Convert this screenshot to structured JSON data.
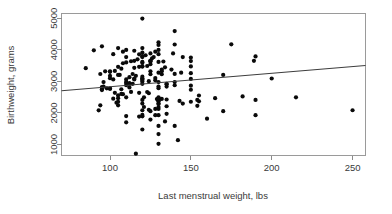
{
  "chart_data": {
    "type": "scatter",
    "title": "",
    "xlabel": "Last menstrual weight, lbs",
    "ylabel": "Birthweight, grams",
    "xlim": [
      70,
      258
    ],
    "ylim": [
      650,
      5150
    ],
    "xticks": [
      100,
      150,
      200,
      250
    ],
    "yticks": [
      1000,
      2000,
      3000,
      4000,
      5000
    ],
    "xtick_labels": [
      "100",
      "150",
      "200",
      "250"
    ],
    "ytick_labels": [
      "1000",
      "2000",
      "3000",
      "4000",
      "5000"
    ],
    "grid": false,
    "legend": "none",
    "point_color": "#0a0a0a",
    "point_size_px": 2.1,
    "n_points": 189,
    "fit_line": {
      "name": "least-squares fit",
      "color": "#3d3d3d",
      "x_start": 70,
      "y_start": 2700,
      "x_end": 258,
      "y_end": 3500,
      "slope": 4.43,
      "intercept": 2390
    },
    "x": [
      182,
      155,
      105,
      108,
      107,
      124,
      118,
      103,
      123,
      113,
      95,
      150,
      95,
      107,
      100,
      100,
      98,
      130,
      112,
      95,
      135,
      96,
      130,
      150,
      140,
      110,
      135,
      112,
      135,
      120,
      114,
      112,
      110,
      96,
      130,
      140,
      110,
      120,
      124,
      128,
      120,
      115,
      110,
      102,
      150,
      120,
      115,
      200,
      120,
      100,
      128,
      112,
      120,
      116,
      100,
      170,
      106,
      105,
      132,
      125,
      94,
      114,
      140,
      150,
      144,
      130,
      100,
      97,
      100,
      125,
      132,
      103,
      138,
      132,
      107,
      85,
      115,
      134,
      118,
      105,
      120,
      150,
      120,
      123,
      125,
      108,
      120,
      110,
      130,
      120,
      133,
      125,
      113,
      150,
      115,
      125,
      125,
      189,
      117,
      126,
      150,
      110,
      120,
      127,
      145,
      190,
      120,
      122,
      118,
      102,
      130,
      139,
      125,
      120,
      108,
      128,
      115,
      90,
      130,
      110,
      120,
      105,
      95,
      130,
      140,
      175,
      130,
      140,
      120,
      116,
      130,
      142,
      130,
      120,
      130,
      140,
      110,
      134,
      125,
      160,
      118,
      120,
      110,
      190,
      130,
      128,
      120,
      135,
      170,
      125,
      93,
      120,
      250,
      124,
      130,
      128,
      121,
      130,
      135,
      154,
      105,
      94,
      130,
      120,
      145,
      130,
      104,
      105,
      150,
      155,
      143,
      130,
      130,
      130,
      154,
      120,
      190,
      130,
      135,
      129,
      132,
      102,
      105,
      165,
      130,
      110,
      121,
      130,
      215,
      215
    ],
    "y": [
      2523,
      2551,
      2557,
      2594,
      2600,
      2622,
      2637,
      2637,
      2663,
      2665,
      2722,
      2733,
      2750,
      2750,
      2769,
      2769,
      2778,
      2782,
      2807,
      2821,
      2835,
      2835,
      2836,
      2863,
      2877,
      2877,
      2906,
      2920,
      2920,
      2920,
      2920,
      2948,
      2948,
      2977,
      2977,
      2977,
      2977,
      2992,
      3005,
      3033,
      3042,
      3062,
      3062,
      3062,
      3076,
      3076,
      3090,
      3090,
      3090,
      3100,
      3104,
      3132,
      3147,
      3175,
      3175,
      3203,
      3203,
      3203,
      3225,
      3225,
      3232,
      3232,
      3234,
      3260,
      3274,
      3274,
      3303,
      3317,
      3317,
      3317,
      3321,
      3331,
      3374,
      3374,
      3402,
      3416,
      3430,
      3444,
      3459,
      3460,
      3473,
      3473,
      3473,
      3487,
      3544,
      3573,
      3586,
      3600,
      3614,
      3614,
      3629,
      3629,
      3637,
      3643,
      3651,
      3651,
      3651,
      3651,
      3699,
      3728,
      3756,
      3770,
      3770,
      3770,
      3770,
      3790,
      3799,
      3827,
      3856,
      3860,
      3860,
      3884,
      3884,
      3912,
      3940,
      3941,
      3969,
      3983,
      3997,
      3997,
      4054,
      4054,
      4111,
      4153,
      4167,
      4174,
      4238,
      4593,
      4990,
      709,
      1021,
      1135,
      1330,
      1474,
      1588,
      1588,
      1701,
      1729,
      1790,
      1818,
      1885,
      1893,
      1899,
      1928,
      1928,
      1928,
      1936,
      1970,
      2055,
      2055,
      2082,
      2084,
      2084,
      2100,
      2125,
      2126,
      2187,
      2187,
      2211,
      2225,
      2240,
      2240,
      2282,
      2296,
      2296,
      2301,
      2325,
      2353,
      2353,
      2367,
      2381,
      2381,
      2381,
      2395,
      2410,
      2410,
      2410,
      2414,
      2424,
      2438,
      2442,
      2450,
      2466,
      2466,
      2466,
      2495,
      2495,
      2495,
      2495
    ]
  },
  "axes": {
    "y_axis_label": "Birthweight, grams",
    "x_axis_label": "Last menstrual weight, lbs"
  }
}
